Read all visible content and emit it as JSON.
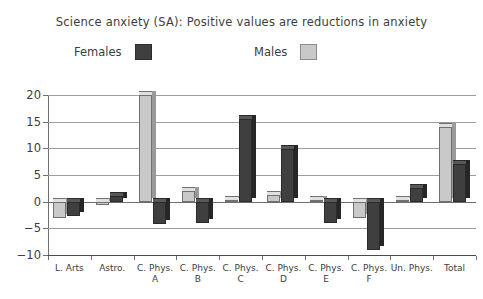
{
  "chart_data": {
    "type": "bar",
    "title": "Science anxiety (SA): Positive values are reductions in anxiety",
    "xlabel": "",
    "ylabel": "",
    "ylim": [
      -10,
      20
    ],
    "yticks": [
      -10,
      -5,
      0,
      5,
      10,
      15,
      20
    ],
    "ytick_labels": [
      "−10",
      "−5",
      "0",
      "5",
      "10",
      "15",
      "20"
    ],
    "grid": true,
    "legend_position": "top",
    "categories": [
      "L. Arts",
      "Astro.",
      "C. Phys. A",
      "C. Phys. B",
      "C. Phys. C",
      "C. Phys. D",
      "C. Phys. E",
      "C. Phys. F",
      "Un. Phys.",
      "Total"
    ],
    "category_lines": [
      [
        "L. Arts",
        ""
      ],
      [
        "Astro.",
        ""
      ],
      [
        "C. Phys.",
        "A"
      ],
      [
        "C. Phys.",
        "B"
      ],
      [
        "C. Phys.",
        "C"
      ],
      [
        "C. Phys.",
        "D"
      ],
      [
        "C. Phys.",
        "E"
      ],
      [
        "C. Phys.",
        "F"
      ],
      [
        "Un. Phys.",
        ""
      ],
      [
        "Total",
        ""
      ]
    ],
    "series": [
      {
        "name": "Males",
        "color": "#c9c9c9",
        "values": [
          -3.0,
          -0.6,
          20.0,
          2.0,
          0.3,
          1.2,
          0.4,
          -3.0,
          0.3,
          14.0
        ]
      },
      {
        "name": "Females",
        "color": "#3f3f3f",
        "values": [
          -2.6,
          1.0,
          -4.2,
          -4.0,
          15.5,
          9.8,
          -4.0,
          -9.0,
          2.6,
          7.0
        ]
      }
    ]
  },
  "legend": {
    "entries": [
      {
        "label": "Females",
        "swatch": "dark"
      },
      {
        "label": "Males",
        "swatch": "light"
      }
    ]
  }
}
